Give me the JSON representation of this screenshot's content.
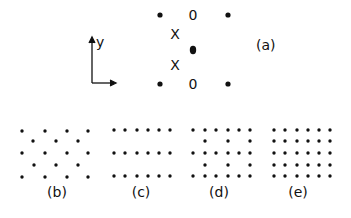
{
  "figure": {
    "panel_a": {
      "label": "(a)",
      "axis_label_y": "y",
      "symbols": [
        {
          "type": "dot",
          "x": 160,
          "y": 15
        },
        {
          "type": "O",
          "text": "0",
          "x": 193,
          "y": 15
        },
        {
          "type": "dot",
          "x": 228,
          "y": 15
        },
        {
          "type": "X",
          "text": "X",
          "x": 175,
          "y": 34
        },
        {
          "type": "dot-in-O",
          "x": 193,
          "y": 50
        },
        {
          "type": "X",
          "text": "X",
          "x": 175,
          "y": 65
        },
        {
          "type": "dot",
          "x": 160,
          "y": 84
        },
        {
          "type": "O",
          "text": "0",
          "x": 193,
          "y": 84
        },
        {
          "type": "dot",
          "x": 228,
          "y": 84
        }
      ]
    },
    "panel_b": {
      "label": "(b)",
      "description": "triangular lattice: rows of 4 and 3 offset dots",
      "rows": [
        {
          "y": 131,
          "xs": [
            22,
            45,
            67,
            88
          ]
        },
        {
          "y": 141,
          "xs": [
            33,
            56,
            78
          ]
        },
        {
          "y": 153,
          "xs": [
            22,
            45,
            67,
            88
          ]
        },
        {
          "y": 165,
          "xs": [
            34,
            56,
            78
          ]
        },
        {
          "y": 177,
          "xs": [
            22,
            45,
            67,
            88
          ]
        }
      ]
    },
    "panel_c": {
      "label": "(c)",
      "description": "three widely spaced rows of 6 dots",
      "rows": [
        {
          "y": 130,
          "xs": [
            114,
            125,
            137,
            148,
            159,
            170
          ]
        },
        {
          "y": 153,
          "xs": [
            114,
            125,
            137,
            148,
            159,
            170
          ]
        },
        {
          "y": 176,
          "xs": [
            114,
            125,
            137,
            148,
            159,
            170
          ]
        }
      ]
    },
    "panel_d": {
      "label": "(d)",
      "description": "full rows of 6 alternating with sparse rows of 3",
      "rows": [
        {
          "y": 130,
          "xs": [
            193,
            205,
            216,
            228,
            239,
            250
          ]
        },
        {
          "y": 141,
          "xs": [
            205,
            228,
            250
          ]
        },
        {
          "y": 153,
          "xs": [
            193,
            205,
            216,
            228,
            239,
            250
          ]
        },
        {
          "y": 165,
          "xs": [
            205,
            228,
            250
          ]
        },
        {
          "y": 176,
          "xs": [
            193,
            205,
            216,
            228,
            239,
            250
          ]
        }
      ]
    },
    "panel_e": {
      "label": "(e)",
      "description": "square lattice 5 rows x 6 columns",
      "rows": [
        {
          "y": 130,
          "xs": [
            274,
            285,
            297,
            308,
            319,
            330
          ]
        },
        {
          "y": 141,
          "xs": [
            274,
            285,
            297,
            308,
            319,
            330
          ]
        },
        {
          "y": 153,
          "xs": [
            274,
            285,
            297,
            308,
            319,
            330
          ]
        },
        {
          "y": 165,
          "xs": [
            274,
            285,
            297,
            308,
            319,
            330
          ]
        },
        {
          "y": 176,
          "xs": [
            274,
            285,
            297,
            308,
            319,
            330
          ]
        }
      ]
    },
    "colors": {
      "ink": "#111111",
      "background": "#ffffff"
    }
  }
}
